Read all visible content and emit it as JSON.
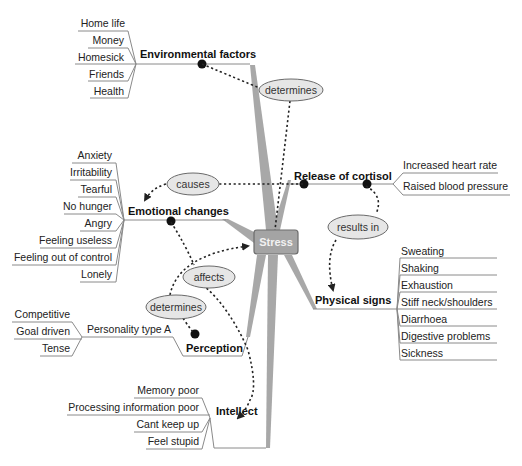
{
  "center": {
    "label": "Stress",
    "fill": "#a4a4a4",
    "stroke": "#6c6c6c"
  },
  "branches": {
    "environmental": {
      "label": "Environmental factors",
      "items": [
        "Home life",
        "Money",
        "Homesick",
        "Friends",
        "Health"
      ]
    },
    "emotional": {
      "label": "Emotional changes",
      "items": [
        "Anxiety",
        "Irritability",
        "Tearful",
        "No hunger",
        "Angry",
        "Feeling useless",
        "Feeling out of control",
        "Lonely"
      ]
    },
    "cortisol": {
      "label": "Release of cortisol",
      "items": [
        "Increased heart rate",
        "Raised blood pressure"
      ]
    },
    "physical": {
      "label": "Physical signs",
      "items": [
        "Sweating",
        "Shaking",
        "Exhaustion",
        "Stiff neck/shoulders",
        "Diarrhoea",
        "Digestive problems",
        "Sickness"
      ]
    },
    "perception": {
      "label": "Perception",
      "sub": {
        "label": "Personality type A",
        "items": [
          "Competitive",
          "Goal driven",
          "Tense"
        ]
      }
    },
    "intellect": {
      "label": "Intellect",
      "items": [
        "Memory poor",
        "Processing information poor",
        "Cant  keep up",
        "Feel stupid"
      ]
    }
  },
  "relations": {
    "determines_top": "determines",
    "causes": "causes",
    "results_in": "results in",
    "affects": "affects",
    "determines_bottom": "determines"
  },
  "colors": {
    "spoke": "#a8a8a8",
    "ellipse_fill": "#e6e6e6",
    "line": "#8a8a8a",
    "dotted": "#222222"
  }
}
